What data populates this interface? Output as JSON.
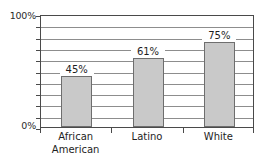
{
  "chart_data": {
    "type": "bar",
    "title": "",
    "subtitle": "",
    "xlabel": "",
    "ylabel": "",
    "categories": [
      "African American",
      "Latino",
      "White"
    ],
    "category_lines": [
      [
        "African",
        "American"
      ],
      [
        "Latino"
      ],
      [
        "White"
      ]
    ],
    "values": [
      45,
      61,
      75
    ],
    "value_labels": [
      "45%",
      "61%",
      "75%"
    ],
    "ylim": [
      0,
      100
    ],
    "ytick_values": [
      0,
      10,
      20,
      30,
      40,
      50,
      60,
      70,
      80,
      90,
      100
    ],
    "ytick_labels_shown": [
      "0%",
      "100%"
    ],
    "axis_min_label": "0%",
    "axis_max_label": "100%",
    "grid": true,
    "grid_interval": 10,
    "legend": "none",
    "legend_position": "none",
    "units": "percent",
    "colors": {
      "bar_fill": "#c9c9c9",
      "bar_border": "#6e6e6e",
      "gridline": "#8d8d8d",
      "axis": "#4a4a4a",
      "text": "#1e1e1e",
      "background": "#ffffff"
    }
  }
}
